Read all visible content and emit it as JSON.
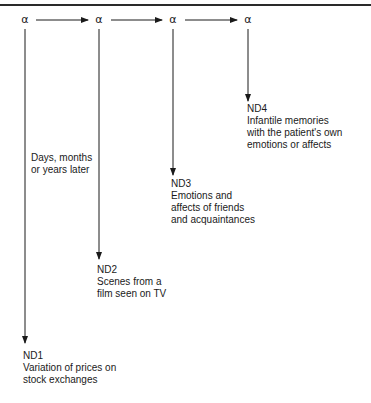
{
  "diagram": {
    "top_rule": true,
    "nodes": [
      {
        "id": "alpha-1",
        "symbol": "α"
      },
      {
        "id": "alpha-2",
        "symbol": "α"
      },
      {
        "id": "alpha-3",
        "symbol": "α"
      },
      {
        "id": "alpha-4",
        "symbol": "α"
      }
    ],
    "time_label": {
      "lines": [
        "Days, months",
        "or years later"
      ]
    },
    "outcomes": [
      {
        "id": "ND1",
        "title": "ND1",
        "lines": [
          "Variation of prices on",
          "stock exchanges"
        ]
      },
      {
        "id": "ND2",
        "title": "ND2",
        "lines": [
          "Scenes from a",
          "film seen on TV"
        ]
      },
      {
        "id": "ND3",
        "title": "ND3",
        "lines": [
          "Emotions and",
          "affects of friends",
          "and acquaintances"
        ]
      },
      {
        "id": "ND4",
        "title": "ND4",
        "lines": [
          "Infantile memories",
          "with the patient's own",
          "emotions or affects"
        ]
      }
    ],
    "edges": [
      {
        "from": "alpha-1",
        "to": "alpha-2",
        "type": "horizontal-arrow"
      },
      {
        "from": "alpha-2",
        "to": "alpha-3",
        "type": "horizontal-arrow"
      },
      {
        "from": "alpha-3",
        "to": "alpha-4",
        "type": "horizontal-arrow"
      },
      {
        "from": "alpha-1",
        "to": "ND1",
        "type": "vertical-arrow"
      },
      {
        "from": "alpha-2",
        "to": "ND2",
        "type": "vertical-arrow"
      },
      {
        "from": "alpha-3",
        "to": "ND3",
        "type": "vertical-arrow"
      },
      {
        "from": "alpha-4",
        "to": "ND4",
        "type": "vertical-arrow"
      }
    ],
    "colors": {
      "line": "#1a1a1a",
      "background": "#ffffff"
    }
  }
}
